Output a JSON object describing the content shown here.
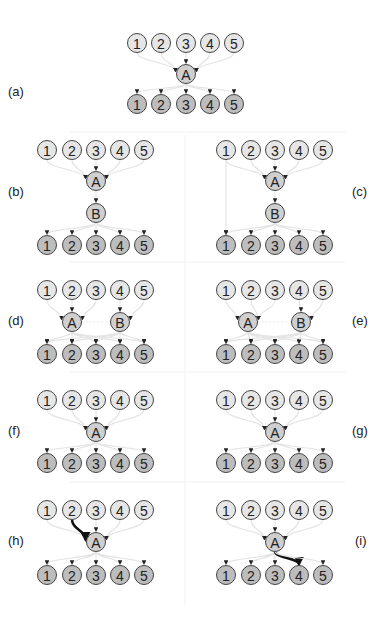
{
  "colors": {
    "background": "#ffffff",
    "input_node_fill": "#e6e6e6",
    "output_node_fill": "#bdbdbd",
    "hidden_node_fill": "#cfcfcf",
    "node_stroke": "#444444",
    "edge_color": "#e4e4e4",
    "highlight_edge_color": "#111111",
    "divider_color": "#f0f0f0"
  },
  "panels": [
    {
      "id": "a",
      "label": "(a)",
      "label_x": 8,
      "label_y": 91
    },
    {
      "id": "b",
      "label": "(b)",
      "label_x": 8,
      "label_y": 191
    },
    {
      "id": "c",
      "label": "(c)",
      "label_x": 355,
      "label_y": 191
    },
    {
      "id": "d",
      "label": "(d)",
      "label_x": 8,
      "label_y": 320
    },
    {
      "id": "e",
      "label": "(e)",
      "label_x": 355,
      "label_y": 320
    },
    {
      "id": "f",
      "label": "(f)",
      "label_x": 8,
      "label_y": 430
    },
    {
      "id": "g",
      "label": "(g)",
      "label_x": 355,
      "label_y": 430
    },
    {
      "id": "h",
      "label": "(h)",
      "label_x": 8,
      "label_y": 540
    },
    {
      "id": "i",
      "label": "(i)",
      "label_x": 357,
      "label_y": 540
    }
  ],
  "node_labels": {
    "inputs": [
      "1",
      "2",
      "3",
      "4",
      "5"
    ],
    "outputs": [
      "1",
      "2",
      "3",
      "4",
      "5"
    ],
    "hidden_a": "A",
    "hidden_b": "B"
  },
  "diagram": {
    "a": {
      "inputs_x": [
        137,
        161,
        186,
        210,
        234
      ],
      "in_y": 43,
      "out_y": 104,
      "hidden": [
        {
          "name": "A",
          "x": 186,
          "y": 74
        }
      ]
    },
    "b": {
      "inputs_x": [
        47,
        72,
        96,
        120,
        144
      ],
      "in_y": 150,
      "out_y": 245,
      "hidden": [
        {
          "name": "A",
          "x": 96,
          "y": 181
        },
        {
          "name": "B",
          "x": 96,
          "y": 213
        }
      ]
    },
    "c": {
      "inputs_x": [
        226,
        251,
        275,
        299,
        323
      ],
      "in_y": 150,
      "out_y": 245,
      "hidden": [
        {
          "name": "A",
          "x": 275,
          "y": 181
        },
        {
          "name": "B",
          "x": 275,
          "y": 213
        }
      ],
      "skip_edge": "input1-to-output1"
    },
    "d": {
      "inputs_x": [
        47,
        72,
        96,
        120,
        144
      ],
      "in_y": 290,
      "out_y": 354,
      "hidden": [
        {
          "name": "A",
          "x": 72,
          "y": 322
        },
        {
          "name": "B",
          "x": 120,
          "y": 322
        }
      ]
    },
    "e": {
      "inputs_x": [
        226,
        251,
        275,
        299,
        323
      ],
      "in_y": 290,
      "out_y": 354,
      "hidden": [
        {
          "name": "A",
          "x": 248,
          "y": 322
        },
        {
          "name": "B",
          "x": 301,
          "y": 322
        }
      ]
    },
    "f": {
      "inputs_x": [
        47,
        72,
        96,
        120,
        144
      ],
      "in_y": 400,
      "out_y": 463,
      "hidden": [
        {
          "name": "A",
          "x": 96,
          "y": 432
        }
      ]
    },
    "g": {
      "inputs_x": [
        226,
        251,
        275,
        299,
        323
      ],
      "in_y": 400,
      "out_y": 463,
      "hidden": [
        {
          "name": "A",
          "x": 275,
          "y": 432
        }
      ]
    },
    "h": {
      "inputs_x": [
        47,
        72,
        96,
        120,
        144
      ],
      "in_y": 510,
      "out_y": 575,
      "hidden": [
        {
          "name": "A",
          "x": 96,
          "y": 542
        }
      ],
      "highlight": "input2-to-A"
    },
    "i": {
      "inputs_x": [
        226,
        251,
        275,
        299,
        323
      ],
      "in_y": 510,
      "out_y": 575,
      "hidden": [
        {
          "name": "A",
          "x": 275,
          "y": 542
        }
      ],
      "highlight": "A-to-output4"
    }
  }
}
